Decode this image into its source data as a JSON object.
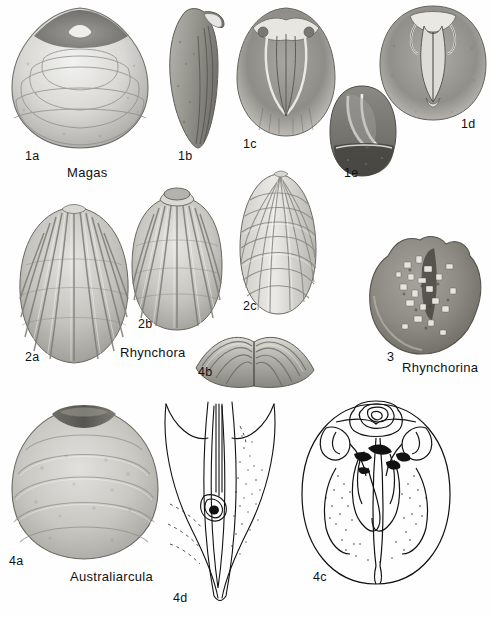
{
  "plate": {
    "title": "Brachiopoda plate",
    "background_color": "#fefefe",
    "ink_color": "#111111"
  },
  "taxa": [
    {
      "id": "magas",
      "label": "Magas",
      "x": 67,
      "y": 173
    },
    {
      "id": "rhynchora",
      "label": "Rhynchora",
      "x": 120,
      "y": 353
    },
    {
      "id": "rhynchorina",
      "label": "Rhynchorina",
      "x": 402,
      "y": 368
    },
    {
      "id": "australiarcula",
      "label": "Australiarcula",
      "x": 70,
      "y": 577
    }
  ],
  "figures": [
    {
      "id": "1a",
      "label": "1a",
      "label_x": 25,
      "label_y": 156,
      "kind": "halftone-shell",
      "view": "dorsal-valve-exterior",
      "cx": 78,
      "cy": 78,
      "rx": 70,
      "ry": 72
    },
    {
      "id": "1b",
      "label": "1b",
      "label_x": 178,
      "label_y": 156,
      "kind": "halftone-shell",
      "view": "lateral-profile",
      "cx": 194,
      "cy": 78,
      "rx": 32,
      "ry": 72
    },
    {
      "id": "1c",
      "label": "1c",
      "label_x": 243,
      "label_y": 144,
      "kind": "halftone-shell",
      "view": "interior-brachial-valve",
      "cx": 285,
      "cy": 72,
      "rx": 48,
      "ry": 64
    },
    {
      "id": "1d",
      "label": "1d",
      "label_x": 461,
      "label_y": 124,
      "kind": "halftone-shell",
      "view": "interior-pedicle-valve",
      "cx": 432,
      "cy": 62,
      "rx": 54,
      "ry": 57
    },
    {
      "id": "1e",
      "label": "1e",
      "label_x": 344,
      "label_y": 173,
      "kind": "halftone-shell",
      "view": "oblique-interior",
      "cx": 361,
      "cy": 130,
      "rx": 33,
      "ry": 45
    },
    {
      "id": "2a",
      "label": "2a",
      "label_x": 25,
      "label_y": 357,
      "kind": "ribbed-shell",
      "view": "exterior-costate",
      "cx": 72,
      "cy": 285,
      "rx": 52,
      "ry": 78
    },
    {
      "id": "2b",
      "label": "2b",
      "label_x": 138,
      "label_y": 324,
      "kind": "ribbed-shell",
      "view": "exterior-with-foramen",
      "cx": 176,
      "cy": 257,
      "rx": 46,
      "ry": 70
    },
    {
      "id": "2c",
      "label": "2c",
      "label_x": 243,
      "label_y": 306,
      "kind": "reticulate-shell",
      "view": "oblique-exterior",
      "cx": 276,
      "cy": 243,
      "rx": 38,
      "ry": 66
    },
    {
      "id": "3",
      "label": "3",
      "label_x": 387,
      "label_y": 357,
      "kind": "granular-shell",
      "view": "umbonal-matrix",
      "cx": 424,
      "cy": 295,
      "rx": 58,
      "ry": 58
    },
    {
      "id": "4a",
      "label": "4a",
      "label_x": 9,
      "label_y": 561,
      "kind": "halftone-shell",
      "view": "exterior-smooth",
      "cx": 82,
      "cy": 480,
      "rx": 72,
      "ry": 78
    },
    {
      "id": "4b",
      "label": "4b",
      "label_x": 198,
      "label_y": 372,
      "kind": "halftone-shell",
      "view": "anterior-commissure",
      "cx": 253,
      "cy": 358,
      "rx": 62,
      "ry": 28
    },
    {
      "id": "4c",
      "label": "4c",
      "label_x": 313,
      "label_y": 577,
      "kind": "line-drawing",
      "view": "interior-valve-diagram",
      "cx": 375,
      "cy": 492,
      "rx": 78,
      "ry": 90
    },
    {
      "id": "4d",
      "label": "4d",
      "label_x": 173,
      "label_y": 598,
      "kind": "line-drawing",
      "view": "umbonal-region-detail",
      "cx": 215,
      "cy": 508,
      "rx": 60,
      "ry": 100
    }
  ]
}
